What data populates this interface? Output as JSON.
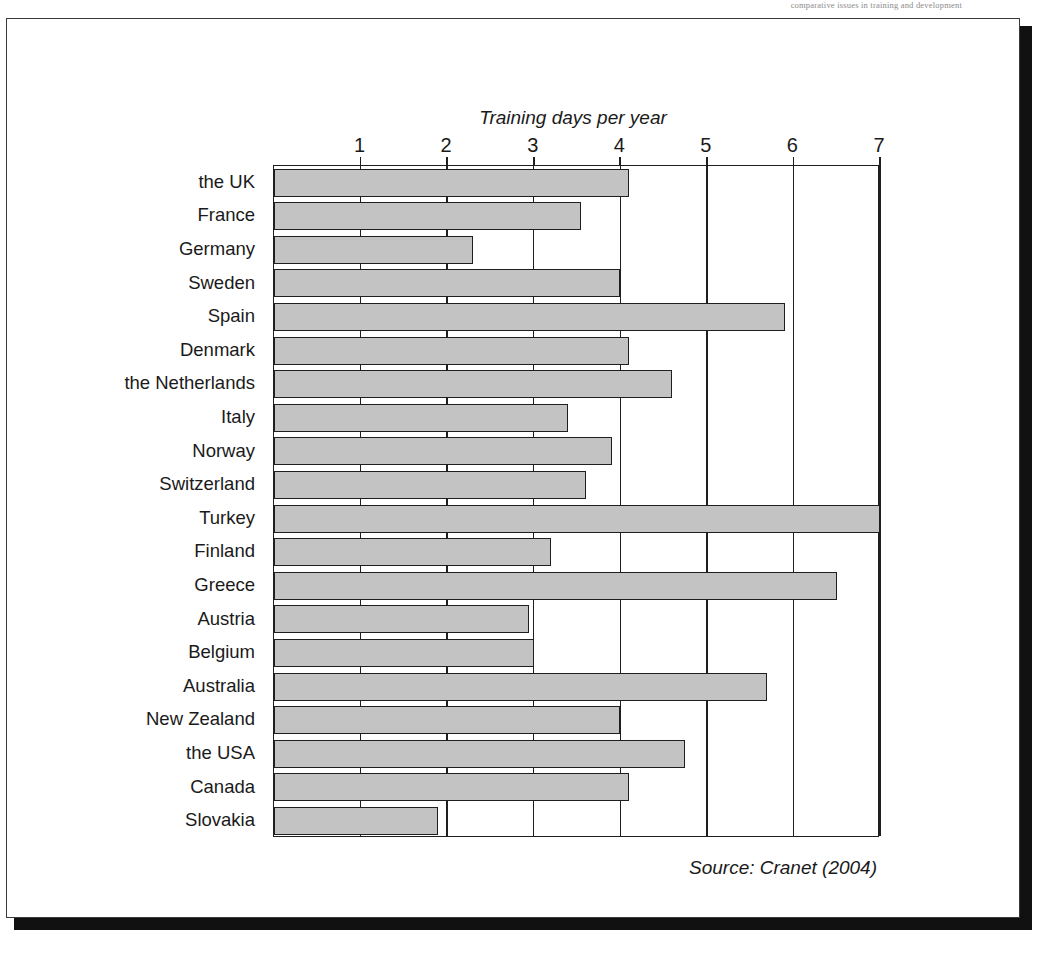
{
  "running_header": "comparative issues in training and development",
  "source_note": "Source: Cranet (2004)",
  "chart_data": {
    "type": "bar",
    "orientation": "horizontal",
    "title": "",
    "xlabel": "Training days per year",
    "ylabel": "",
    "xlim": [
      0,
      7
    ],
    "xticks": [
      1,
      2,
      3,
      4,
      5,
      6,
      7
    ],
    "xtick_labels": [
      "1",
      "2",
      "3",
      "4",
      "5",
      "6",
      "7"
    ],
    "grid": true,
    "legend": false,
    "bar_fill_color": "#c3c3c3",
    "bar_edge_color": "#1f1f1f",
    "categories": [
      "the UK",
      "France",
      "Germany",
      "Sweden",
      "Spain",
      "Denmark",
      "the Netherlands",
      "Italy",
      "Norway",
      "Switzerland",
      "Turkey",
      "Finland",
      "Greece",
      "Austria",
      "Belgium",
      "Australia",
      "New Zealand",
      "the USA",
      "Canada",
      "Slovakia"
    ],
    "values": [
      4.1,
      3.55,
      2.3,
      4.0,
      5.9,
      4.1,
      4.6,
      3.4,
      3.9,
      3.6,
      7.0,
      3.2,
      6.5,
      2.95,
      3.0,
      5.7,
      4.0,
      4.75,
      4.1,
      1.9
    ]
  }
}
